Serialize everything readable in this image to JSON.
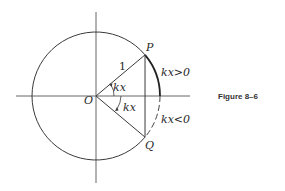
{
  "figure": {
    "caption": "Figure 8–6",
    "labels": {
      "origin": "O",
      "point_p": "P",
      "point_q": "Q",
      "radius": "1",
      "angle_upper": "kx",
      "angle_lower": "kx",
      "arc_positive": "kx>0",
      "arc_negative": "kx<0"
    },
    "colors": {
      "stroke": "#3a3a3a",
      "axis": "#555555",
      "text": "#2a2a2a"
    }
  }
}
